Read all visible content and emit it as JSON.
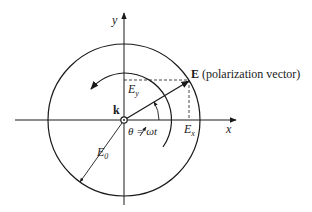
{
  "diagram": {
    "labels": {
      "y_axis": "y",
      "x_axis": "x",
      "e_vector_bold": "E",
      "e_vector_desc": " (polarization vector)",
      "ey_main": "E",
      "ey_sub": "y",
      "ex_main": "E",
      "ex_sub": "x",
      "k": "k",
      "theta": "θ = ωt",
      "e0_main": "E",
      "e0_sub": "0"
    },
    "colors": {
      "stroke": "#1a1a1a",
      "background": "#ffffff"
    }
  }
}
